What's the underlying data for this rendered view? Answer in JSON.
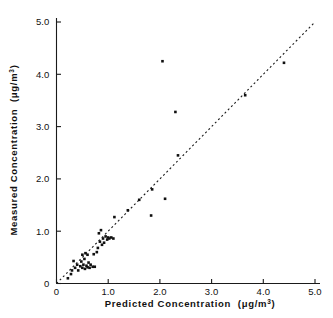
{
  "figure": {
    "background": "#ffffff",
    "foreground": "#101010",
    "width": 333,
    "height": 318
  },
  "axes": {
    "x_title_main": "Predicted  Concentration",
    "x_title_units_open": "(μg/m",
    "x_title_units_exp": "3",
    "x_title_units_close": ")",
    "y_title_main": "Measured  Concentration",
    "y_title_units_open": "(μg/m",
    "y_title_units_exp": "3",
    "y_title_units_close": ")",
    "x_ticks": [
      "0",
      "1.0",
      "2.0",
      "3.0",
      "4.0",
      "5.0"
    ],
    "y_ticks": [
      "0",
      "1.0",
      "2.0",
      "3.0",
      "4.0",
      "5.0"
    ]
  },
  "chart_data": {
    "type": "scatter",
    "title": "",
    "xlabel": "Predicted Concentration (μg/m3)",
    "ylabel": "Measured Concentration (μg/m3)",
    "xlim": [
      0,
      5.0
    ],
    "ylim": [
      0,
      5.0
    ],
    "xticks": [
      0,
      1.0,
      2.0,
      3.0,
      4.0,
      5.0
    ],
    "yticks": [
      0,
      1.0,
      2.0,
      3.0,
      4.0,
      5.0
    ],
    "xtick_labels": [
      "0",
      "1.0",
      "2.0",
      "3.0",
      "4.0",
      "5.0"
    ],
    "ytick_labels": [
      "0",
      "1.0",
      "2.0",
      "3.0",
      "4.0",
      "5.0"
    ],
    "grid": false,
    "legend": null,
    "marker": "filled-square",
    "marker_size_px": 2.6,
    "reference_line": {
      "label": "1:1 identity line",
      "style": "dashed",
      "x": [
        0.0,
        5.0
      ],
      "y": [
        0.0,
        5.0
      ]
    },
    "points": [
      {
        "x": 0.22,
        "y": 0.1
      },
      {
        "x": 0.28,
        "y": 0.18
      },
      {
        "x": 0.3,
        "y": 0.25
      },
      {
        "x": 0.33,
        "y": 0.43
      },
      {
        "x": 0.36,
        "y": 0.3
      },
      {
        "x": 0.4,
        "y": 0.36
      },
      {
        "x": 0.42,
        "y": 0.25
      },
      {
        "x": 0.46,
        "y": 0.33
      },
      {
        "x": 0.48,
        "y": 0.42
      },
      {
        "x": 0.5,
        "y": 0.3
      },
      {
        "x": 0.5,
        "y": 0.55
      },
      {
        "x": 0.52,
        "y": 0.36
      },
      {
        "x": 0.54,
        "y": 0.47
      },
      {
        "x": 0.55,
        "y": 0.28
      },
      {
        "x": 0.56,
        "y": 0.58
      },
      {
        "x": 0.58,
        "y": 0.34
      },
      {
        "x": 0.6,
        "y": 0.31
      },
      {
        "x": 0.6,
        "y": 0.55
      },
      {
        "x": 0.62,
        "y": 0.4
      },
      {
        "x": 0.64,
        "y": 0.3
      },
      {
        "x": 0.66,
        "y": 0.36
      },
      {
        "x": 0.7,
        "y": 0.32
      },
      {
        "x": 0.72,
        "y": 0.56
      },
      {
        "x": 0.74,
        "y": 0.32
      },
      {
        "x": 0.78,
        "y": 0.6
      },
      {
        "x": 0.8,
        "y": 0.68
      },
      {
        "x": 0.82,
        "y": 0.96
      },
      {
        "x": 0.84,
        "y": 0.8
      },
      {
        "x": 0.86,
        "y": 1.02
      },
      {
        "x": 0.88,
        "y": 0.74
      },
      {
        "x": 0.9,
        "y": 0.86
      },
      {
        "x": 0.92,
        "y": 0.78
      },
      {
        "x": 0.95,
        "y": 0.9
      },
      {
        "x": 0.98,
        "y": 0.84
      },
      {
        "x": 1.0,
        "y": 0.88
      },
      {
        "x": 1.02,
        "y": 0.86
      },
      {
        "x": 1.06,
        "y": 0.88
      },
      {
        "x": 1.1,
        "y": 0.86
      },
      {
        "x": 1.12,
        "y": 1.27
      },
      {
        "x": 1.38,
        "y": 1.4
      },
      {
        "x": 1.6,
        "y": 1.6
      },
      {
        "x": 1.83,
        "y": 1.3
      },
      {
        "x": 1.85,
        "y": 1.8
      },
      {
        "x": 2.05,
        "y": 4.25
      },
      {
        "x": 2.1,
        "y": 1.62
      },
      {
        "x": 2.3,
        "y": 3.28
      },
      {
        "x": 2.35,
        "y": 2.45
      },
      {
        "x": 3.65,
        "y": 3.6
      },
      {
        "x": 4.4,
        "y": 4.22
      }
    ]
  }
}
